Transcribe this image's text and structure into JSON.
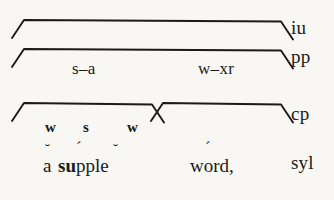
{
  "diagram": {
    "type": "prosodic-constituent-tree",
    "background_color": "#f8f7f4",
    "ink_color": "#1a1a1a",
    "tiers": [
      {
        "id": "iu",
        "label": "iu"
      },
      {
        "id": "pp",
        "label": "pp"
      },
      {
        "id": "cp",
        "label": "cp"
      },
      {
        "id": "syl",
        "label": "syl"
      }
    ],
    "pp_row": {
      "items": [
        {
          "id": "pp-left",
          "text": "s–a"
        },
        {
          "id": "pp-right",
          "text": "w–xr"
        }
      ]
    },
    "cp_row": {
      "strength_marks": [
        {
          "id": "sw-1",
          "text": "w"
        },
        {
          "id": "sw-2",
          "text": "s"
        },
        {
          "id": "sw-3",
          "text": "w"
        }
      ]
    },
    "syllable_row": {
      "word_1": "a",
      "word_2_bold": "su",
      "word_2_rest": "pple",
      "word_3": "word,",
      "diacritics": [
        {
          "id": "dia-a",
          "mark": "˘",
          "over": "a"
        },
        {
          "id": "dia-u",
          "mark": "´",
          "over": "u"
        },
        {
          "id": "dia-e",
          "mark": "˘",
          "over": "e"
        },
        {
          "id": "dia-o",
          "mark": "´",
          "over": "o"
        }
      ]
    },
    "brackets": [
      {
        "id": "bracket-iu",
        "tier": "iu",
        "x1": 24,
        "x2": 281,
        "top": 20,
        "leg": 18
      },
      {
        "id": "bracket-pp",
        "tier": "pp",
        "x1": 24,
        "x2": 281,
        "top": 49,
        "leg": 18
      },
      {
        "id": "bracket-cp-left",
        "tier": "cp",
        "x1": 24,
        "x2": 152,
        "top": 103,
        "leg": 18
      },
      {
        "id": "bracket-cp-right",
        "tier": "cp",
        "x1": 163,
        "x2": 281,
        "top": 103,
        "leg": 18
      }
    ]
  }
}
